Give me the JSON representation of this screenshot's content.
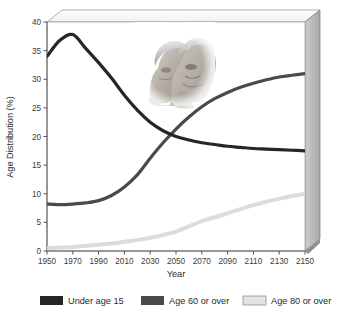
{
  "chart_data": {
    "type": "line",
    "title": "",
    "xlabel": "Year",
    "ylabel": "Age Distribution (%)",
    "xlim": [
      1950,
      2150
    ],
    "ylim": [
      0,
      40
    ],
    "grid": false,
    "legend_position": "bottom",
    "xticks": [
      "1950",
      "1970",
      "1990",
      "2010",
      "2030",
      "2050",
      "2070",
      "2090",
      "2110",
      "2130",
      "2150"
    ],
    "yticks": [
      "0",
      "5",
      "10",
      "15",
      "20",
      "25",
      "30",
      "35",
      "40"
    ],
    "x": [
      1950,
      1960,
      1970,
      1980,
      1990,
      2000,
      2010,
      2020,
      2030,
      2040,
      2050,
      2060,
      2070,
      2080,
      2090,
      2100,
      2110,
      2120,
      2130,
      2140,
      2150
    ],
    "series": [
      {
        "name": "Under age 15",
        "color": "#262626",
        "values": [
          34.0,
          36.8,
          37.8,
          35.4,
          32.9,
          30.2,
          27.2,
          24.6,
          22.5,
          21.0,
          20.0,
          19.4,
          18.9,
          18.6,
          18.3,
          18.1,
          17.9,
          17.8,
          17.7,
          17.6,
          17.5
        ]
      },
      {
        "name": "Age 60 or over",
        "color": "#4a4a4a",
        "values": [
          8.2,
          8.1,
          8.2,
          8.4,
          8.8,
          9.7,
          11.2,
          13.3,
          16.2,
          18.9,
          21.3,
          23.4,
          25.2,
          26.6,
          27.7,
          28.6,
          29.3,
          29.9,
          30.4,
          30.7,
          31.0
        ]
      },
      {
        "name": "Age 80 or over",
        "color": "#dcdcdc",
        "values": [
          0.5,
          0.6,
          0.7,
          0.9,
          1.1,
          1.3,
          1.6,
          1.9,
          2.3,
          2.8,
          3.4,
          4.3,
          5.2,
          5.9,
          6.6,
          7.3,
          8.0,
          8.6,
          9.1,
          9.6,
          10.0
        ]
      }
    ],
    "annotations": [
      {
        "kind": "image",
        "name": "elderly-couple-photo",
        "description": "Grayscale photograph of an elderly woman and elderly man"
      }
    ]
  },
  "legend": {
    "items": [
      {
        "label": "Under age 15",
        "color": "#262626",
        "swatch": "under-15-swatch"
      },
      {
        "label": "Age 60 or over",
        "color": "#4a4a4a",
        "swatch": "age-60-swatch"
      },
      {
        "label": "Age 80 or over",
        "color": "#e4e4e4",
        "swatch": "age-80-swatch"
      }
    ]
  },
  "frame": {
    "wall_color": "#b9b9b9",
    "edge_color": "#6f6f6f",
    "axis_color": "#555555"
  }
}
